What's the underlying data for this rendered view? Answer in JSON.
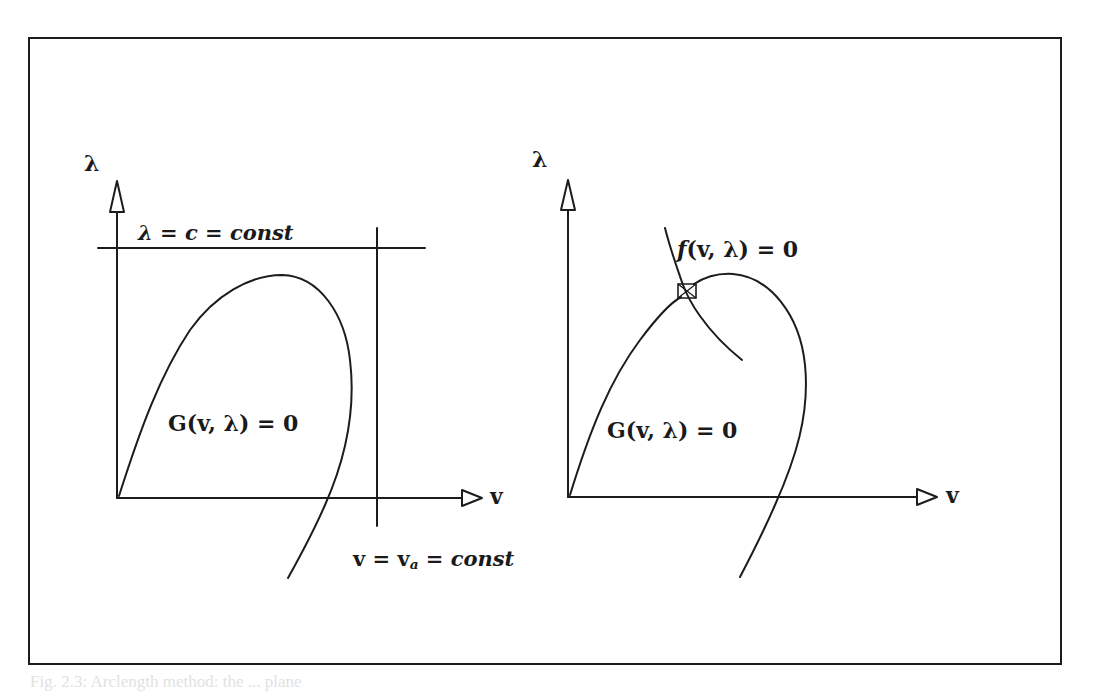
{
  "figure": {
    "left_panel": {
      "y_axis_label": "λ",
      "x_axis_label": "v",
      "horizontal_constraint_label": "λ = c = const",
      "vertical_constraint_label_main": "v = v",
      "vertical_constraint_label_sub": "a",
      "vertical_constraint_label_tail": " = const",
      "curve_label": "G(v, λ) = 0"
    },
    "right_panel": {
      "y_axis_label": "λ",
      "x_axis_label": "v",
      "constraint_curve_label_f": "f",
      "constraint_curve_label_rest": "(v, λ) = 0",
      "curve_label": "G(v, λ) = 0",
      "intersection_marker": "square-marker"
    },
    "colors": {
      "ink": "#1c1c1c",
      "background": "#ffffff"
    }
  },
  "bleed_through_caption": "Fig. 2.3: Arclength method: the ... plane"
}
